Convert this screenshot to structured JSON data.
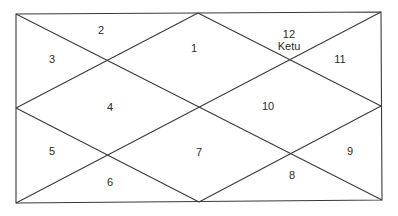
{
  "diagram": {
    "type": "north-indian-birth-chart",
    "frame": {
      "top_left": [
        16,
        14
      ],
      "top_right": [
        381,
        12
      ],
      "bottom_right": [
        382,
        200
      ],
      "bottom_left": [
        16,
        203
      ]
    },
    "houses": [
      {
        "number": "1",
        "planets": "",
        "x": 194,
        "y": 48
      },
      {
        "number": "2",
        "planets": "",
        "x": 101,
        "y": 30
      },
      {
        "number": "3",
        "planets": "",
        "x": 52,
        "y": 59
      },
      {
        "number": "4",
        "planets": "",
        "x": 110,
        "y": 107
      },
      {
        "number": "5",
        "planets": "",
        "x": 52,
        "y": 151
      },
      {
        "number": "6",
        "planets": "",
        "x": 110,
        "y": 182
      },
      {
        "number": "7",
        "planets": "",
        "x": 199,
        "y": 152
      },
      {
        "number": "8",
        "planets": "",
        "x": 292,
        "y": 175
      },
      {
        "number": "9",
        "planets": "",
        "x": 350,
        "y": 151
      },
      {
        "number": "10",
        "planets": "",
        "x": 268,
        "y": 106
      },
      {
        "number": "11",
        "planets": "",
        "x": 340,
        "y": 59
      },
      {
        "number": "12",
        "planets": "Ketu",
        "x": 289,
        "y": 34
      }
    ]
  }
}
